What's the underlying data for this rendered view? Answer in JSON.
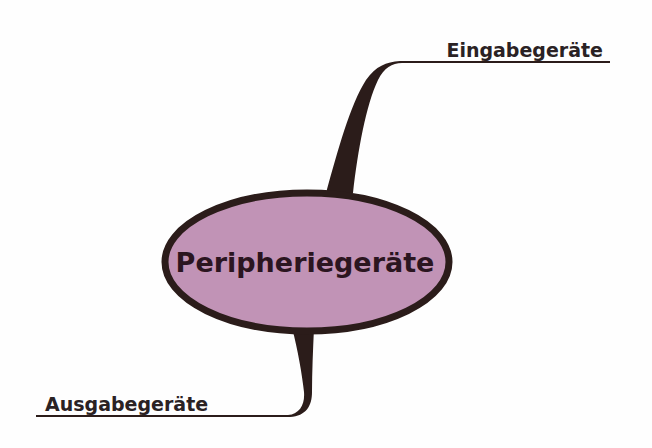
{
  "mindmap": {
    "center": {
      "label": "Peripheriegeräte",
      "fill_color": "#c193b6",
      "border_color": "#2b1c1a"
    },
    "branches": [
      {
        "label": "Eingabegeräte",
        "position": "top-right"
      },
      {
        "label": "Ausgabegeräte",
        "position": "bottom-left"
      }
    ],
    "line_color": "#2b1c1a"
  }
}
